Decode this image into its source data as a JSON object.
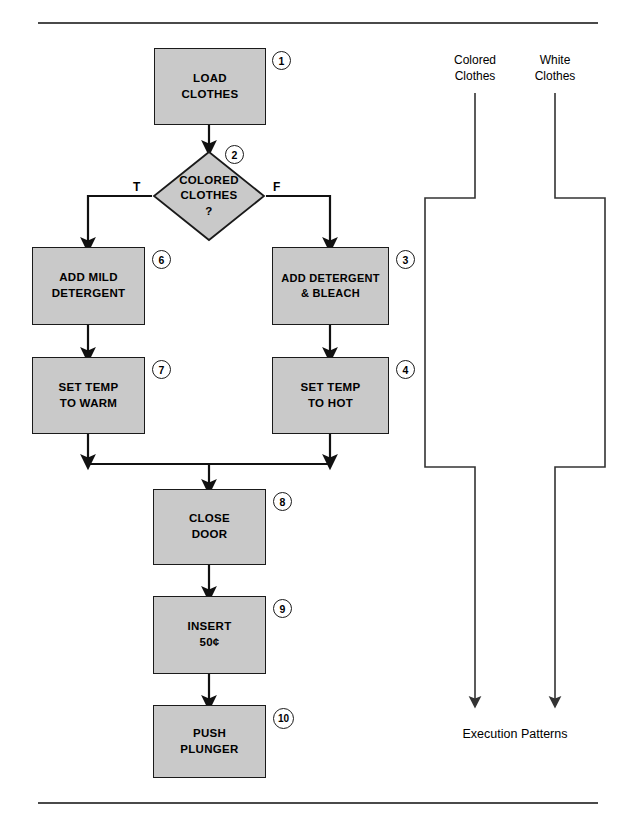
{
  "page": {
    "background": "#ffffff",
    "box_fill": "#c9c9c9",
    "line_color": "#111111",
    "rule_color": "#4a4a4a"
  },
  "rules": {
    "top_label": "top-divider-rule",
    "bottom_label": "bottom-divider-rule"
  },
  "flowchart": {
    "nodes": [
      {
        "id": "n1",
        "badge": "1",
        "type": "process",
        "line1": "LOAD",
        "line2": "CLOTHES"
      },
      {
        "id": "n2",
        "badge": "2",
        "type": "decision",
        "line1": "COLORED",
        "line2": "CLOTHES",
        "line3": "?"
      },
      {
        "id": "n6",
        "badge": "6",
        "type": "process",
        "line1": "ADD MILD",
        "line2": "DETERGENT"
      },
      {
        "id": "n3",
        "badge": "3",
        "type": "process",
        "line1": "ADD DETERGENT",
        "line2": "& BLEACH"
      },
      {
        "id": "n7",
        "badge": "7",
        "type": "process",
        "line1": "SET TEMP",
        "line2": "TO WARM"
      },
      {
        "id": "n4",
        "badge": "4",
        "type": "process",
        "line1": "SET TEMP",
        "line2": "TO HOT"
      },
      {
        "id": "n8",
        "badge": "8",
        "type": "process",
        "line1": "CLOSE",
        "line2": "DOOR"
      },
      {
        "id": "n9",
        "badge": "9",
        "type": "process",
        "line1": "INSERT",
        "line2": "50¢"
      },
      {
        "id": "n10",
        "badge": "10",
        "type": "process",
        "line1": "PUSH",
        "line2": "PLUNGER"
      }
    ],
    "branch_labels": {
      "true": "T",
      "false": "F"
    }
  },
  "execution_patterns": {
    "title": "Execution Patterns",
    "paths": [
      {
        "id": "colored",
        "caption_line1": "Colored",
        "caption_line2": "Clothes"
      },
      {
        "id": "white",
        "caption_line1": "White",
        "caption_line2": "Clothes"
      }
    ]
  }
}
